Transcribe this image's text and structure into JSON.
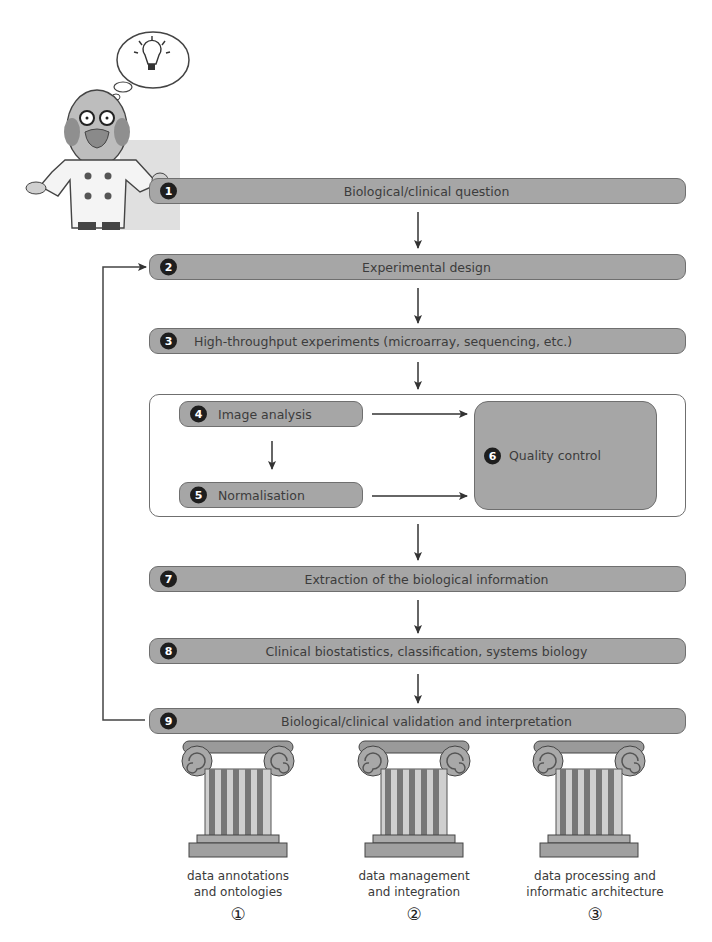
{
  "figure": {
    "scientist": {
      "name": "scientist-illustration",
      "thought": "light-bulb-icon"
    },
    "steps": [
      {
        "num": "1",
        "label": "Biological/clinical question"
      },
      {
        "num": "2",
        "label": "Experimental design"
      },
      {
        "num": "3",
        "label": "High-throughput experiments (microarray, sequencing, etc.)"
      },
      {
        "num": "4",
        "label": "Image analysis"
      },
      {
        "num": "5",
        "label": "Normalisation"
      },
      {
        "num": "6",
        "label": "Quality control"
      },
      {
        "num": "7",
        "label": "Extraction of the biological information"
      },
      {
        "num": "8",
        "label": "Clinical biostatistics, classification, systems biology"
      },
      {
        "num": "9",
        "label": "Biological/clinical validation and interpretation"
      }
    ],
    "pillars": [
      {
        "line1": "data annotations",
        "line2": "and ontologies",
        "num": "①"
      },
      {
        "line1": "data management",
        "line2": "and integration",
        "num": "②"
      },
      {
        "line1": "data processing and",
        "line2": "informatic architecture",
        "num": "③"
      }
    ],
    "colors": {
      "bar_fill": "#a6a6a6",
      "bar_border": "#6f6f6f",
      "badge": "#1e1e1e",
      "arrow": "#333333"
    }
  }
}
